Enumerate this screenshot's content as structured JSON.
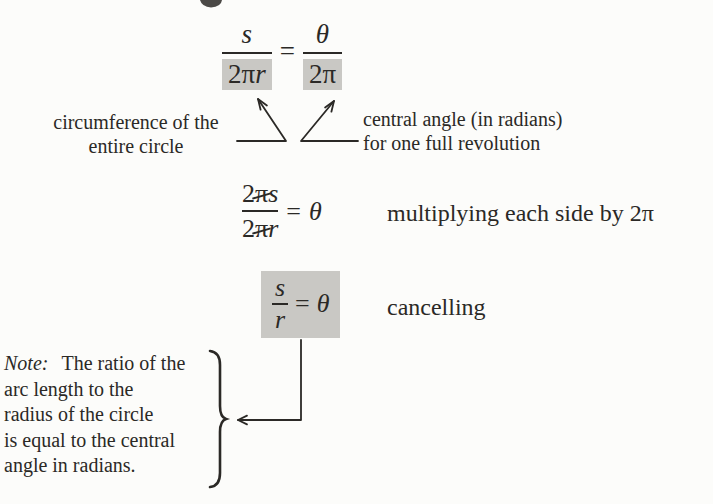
{
  "page": {
    "background": "#fcfcfa",
    "ink_color": "#2b2926",
    "highlight_color": "#c9c8c4"
  },
  "equation1": {
    "left_numerator": "s",
    "left_den_coeff": "2π",
    "left_den_var": "r",
    "equals": "=",
    "right_numerator": "θ",
    "right_denominator": "2π"
  },
  "pointer_labels": {
    "left": {
      "line1": "circumference of the",
      "line2": "entire circle"
    },
    "right": {
      "line1": "central angle (in radians)",
      "line2": "for one full revolution"
    }
  },
  "equation2": {
    "num_coeff": "2",
    "num_pi": "π",
    "num_var": "s",
    "den_coeff": "2",
    "den_pi": "π",
    "den_var": "r",
    "equals": "=",
    "result": "θ",
    "caption": "multiplying each side by 2π"
  },
  "equation3": {
    "numerator": "s",
    "denominator": "r",
    "equals": "=",
    "result": "θ",
    "caption": "cancelling"
  },
  "note": {
    "label": "Note:",
    "lines": [
      "The ratio of the",
      "arc length to the",
      "radius of the circle",
      "is equal to the central",
      "angle in radians."
    ]
  }
}
